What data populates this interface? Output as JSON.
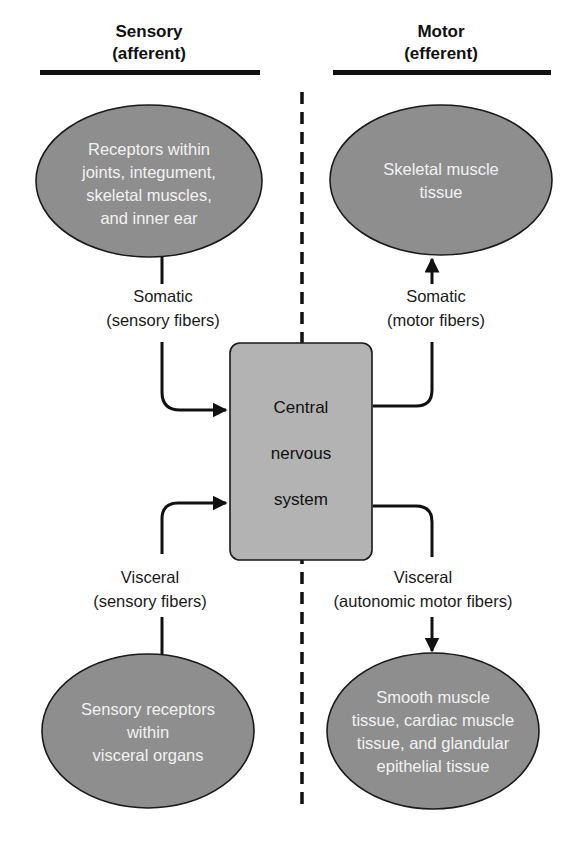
{
  "headers": {
    "sensory": {
      "line1": "Sensory",
      "line2": "(afferent)"
    },
    "motor": {
      "line1": "Motor",
      "line2": "(efferent)"
    }
  },
  "center": {
    "line1": "Central",
    "line2": "nervous",
    "line3": "system"
  },
  "ovals": {
    "somatic_receptors": [
      "Receptors within",
      "joints, integument,",
      "skeletal muscles,",
      "and inner ear"
    ],
    "skeletal_muscle": [
      "Skeletal muscle",
      "tissue"
    ],
    "visceral_receptors": [
      "Sensory receptors",
      "within",
      "visceral organs"
    ],
    "visceral_effectors": [
      "Smooth muscle",
      "tissue, cardiac muscle",
      "tissue, and glandular",
      "epithelial tissue"
    ]
  },
  "labels": {
    "somatic_sensory": [
      "Somatic",
      "(sensory fibers)"
    ],
    "somatic_motor": [
      "Somatic",
      "(motor fibers)"
    ],
    "visceral_sensory": [
      "Visceral",
      "(sensory fibers)"
    ],
    "visceral_motor": [
      "Visceral",
      "(autonomic motor fibers)"
    ]
  },
  "colors": {
    "oval_fill": "#8e8e8e",
    "box_fill": "#b3b3b3",
    "line": "#111111"
  }
}
